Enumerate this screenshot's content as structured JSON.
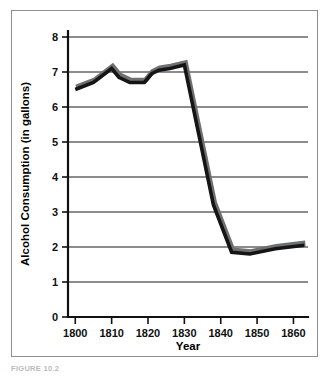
{
  "figure": {
    "caption": "FIGURE 10.2",
    "frame_color": "#8d8f90",
    "background": "#ffffff"
  },
  "chart_data": {
    "type": "line",
    "title": "",
    "xlabel": "Year",
    "ylabel": "Alcohol Consumption (in gallons)",
    "xlim": [
      1798,
      1864
    ],
    "ylim": [
      0,
      8
    ],
    "grid": true,
    "legend_position": "none",
    "line_color": "#151515",
    "line_shadow_color": "#6f7072",
    "x_tick_labels": [
      "1800",
      "1810",
      "1820",
      "1830",
      "1840",
      "1850",
      "1860"
    ],
    "x_ticks": [
      1800,
      1810,
      1820,
      1830,
      1840,
      1850,
      1860
    ],
    "y_tick_labels": [
      "0",
      "1",
      "2",
      "3",
      "4",
      "5",
      "6",
      "7",
      "8"
    ],
    "y_ticks": [
      0,
      1,
      2,
      3,
      4,
      5,
      6,
      7,
      8
    ],
    "x": [
      1800,
      1805,
      1810,
      1812,
      1815,
      1819,
      1821,
      1823,
      1826,
      1830,
      1838,
      1843,
      1848,
      1855,
      1863
    ],
    "values": [
      6.5,
      6.7,
      7.1,
      6.85,
      6.7,
      6.7,
      6.95,
      7.05,
      7.1,
      7.2,
      3.2,
      1.85,
      1.8,
      1.95,
      2.05
    ],
    "series": [
      {
        "name": "Alcohol Consumption",
        "values": [
          6.5,
          6.7,
          7.1,
          6.85,
          6.7,
          6.7,
          6.95,
          7.05,
          7.1,
          7.2,
          3.2,
          1.85,
          1.8,
          1.95,
          2.05
        ]
      }
    ]
  }
}
